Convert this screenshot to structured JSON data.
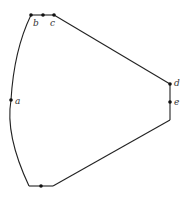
{
  "diagram": {
    "type": "polygon-with-labeled-points",
    "labels": {
      "a": "a",
      "b": "b",
      "c": "c",
      "d": "d",
      "e": "e"
    },
    "vertices": [
      "a",
      "b",
      "c",
      "d",
      "e"
    ],
    "edges": [
      {
        "from": "bottom-left-corner",
        "to": "top-left-corner",
        "shape": "curve"
      },
      {
        "from": "top-left-corner",
        "to": "top-right-corner",
        "shape": "straight"
      },
      {
        "from": "top-right-corner",
        "to": "d",
        "shape": "straight"
      },
      {
        "from": "d",
        "to": "bottom-right-corner",
        "shape": "straight"
      },
      {
        "from": "bottom-right-corner",
        "to": "bottom-segment-right",
        "shape": "straight"
      },
      {
        "from": "bottom-segment-right",
        "to": "bottom-left-corner",
        "shape": "straight"
      }
    ]
  }
}
